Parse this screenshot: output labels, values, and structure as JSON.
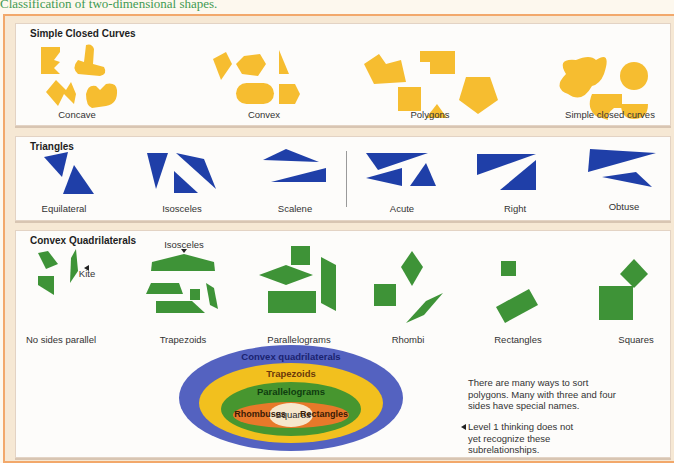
{
  "caption": "Classification of two-dimensional shapes.",
  "colors": {
    "yellow": "#f6bd30",
    "blue": "#1f3fa8",
    "green": "#3e9337",
    "frame": "#f2a86b",
    "ellipse_outer": "#5462c0",
    "ellipse_trapezoid": "#f2c01e",
    "ellipse_parallelogram": "#47962f",
    "ellipse_inner": "#e8792a",
    "ellipse_center": "#f6e7cd"
  },
  "sections": {
    "simple_closed_curves": {
      "title": "Simple Closed Curves",
      "groups": [
        "Concave",
        "Convex",
        "Polygons",
        "Simple closed curves"
      ]
    },
    "triangles": {
      "title": "Triangles",
      "groups": [
        "Equilateral",
        "Isosceles",
        "Scalene",
        "Acute",
        "Right",
        "Obtuse"
      ]
    },
    "convex_quadrilaterals": {
      "title": "Convex Quadrilaterals",
      "groups": [
        "No sides parallel",
        "Trapezoids",
        "Parallelograms",
        "Rhombi",
        "Rectangles",
        "Squares"
      ],
      "annotations": {
        "kite": "Kite",
        "isosceles": "Isosceles"
      }
    }
  },
  "venn": {
    "outer": "Convex quadrilaterals",
    "level2": "Trapezoids",
    "level3": "Parallelograms",
    "inner_left": "Rhombuses",
    "inner_center": "Squares",
    "inner_right": "Rectangles"
  },
  "notes": {
    "sorting": "There are many ways to sort polygons. Many with three and four sides have special names.",
    "level1": "Level 1 thinking does not yet recognize these subrelationships."
  }
}
